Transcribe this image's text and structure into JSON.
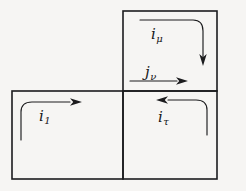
{
  "figure": {
    "kind": "lattice-plaquette-current-diagram",
    "background_color": "#f6f5f3",
    "ink_color": "#1c1c1e",
    "squares": [
      {
        "name": "top-right-plaquette",
        "x": 123,
        "y": 11,
        "w": 94,
        "h": 80
      },
      {
        "name": "bottom-left-plaquette",
        "x": 12,
        "y": 91,
        "w": 111,
        "h": 88
      },
      {
        "name": "bottom-right-plaquette",
        "x": 123,
        "y": 91,
        "w": 94,
        "h": 88
      }
    ],
    "labels": [
      {
        "id": "i_mu",
        "base": "i",
        "sub": "μ",
        "x": 151,
        "y": 26
      },
      {
        "id": "j_nu",
        "base": "j",
        "sub": "ν",
        "x": 145,
        "y": 64
      },
      {
        "id": "i_1",
        "base": "i",
        "sub": "1",
        "x": 39,
        "y": 108
      },
      {
        "id": "i_tau",
        "base": "i",
        "sub": "τ",
        "x": 158,
        "y": 109
      }
    ],
    "arrows": [
      {
        "id": "i-mu-arrow",
        "description": "curved arrow, rightward along top then turning down the right side of the top-right square, arrowhead pointing down",
        "path": "M 140 20 L 193 20 Q 203 20 203 31 L 203 57",
        "head": "down",
        "head_at": [
          203,
          64
        ]
      },
      {
        "id": "j-nu-arrow",
        "description": "straight horizontal arrow pointing right, below the j-nu label",
        "path": "M 130 81 L 177 81",
        "head": "right",
        "head_at": [
          186,
          81
        ]
      },
      {
        "id": "i-1-arrow",
        "description": "curved arrow, upward along the left then turning right across the top of the bottom-left square, arrowhead pointing right",
        "path": "M 21 140 L 21 112 Q 21 102 32 102 L 70 102",
        "head": "right",
        "head_at": [
          80,
          102
        ]
      },
      {
        "id": "i-tau-arrow",
        "description": "curved arrow, upward along the right then turning left across the top of the bottom-right square, arrowhead pointing left",
        "path": "M 207 135 L 207 110 Q 207 100 196 100 L 168 100",
        "head": "left",
        "head_at": [
          158,
          100
        ]
      }
    ]
  }
}
